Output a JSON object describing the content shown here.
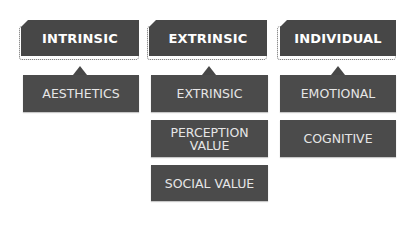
{
  "diagram": {
    "columns": [
      {
        "header": "INTRINSIC",
        "children": [
          "AESTHETICS"
        ]
      },
      {
        "header": "EXTRINSIC",
        "children": [
          "EXTRINSIC",
          "PERCEPTION\nVALUE",
          "SOCIAL VALUE"
        ]
      },
      {
        "header": "INDIVIDUAL",
        "children": [
          "EMOTIONAL",
          "COGNITIVE"
        ]
      }
    ],
    "colors": {
      "header_fill": "#474747",
      "child_fill": "#4b4b4b",
      "header_text": "#ffffff",
      "child_text": "#e6e6e6",
      "background": "#ffffff"
    }
  }
}
